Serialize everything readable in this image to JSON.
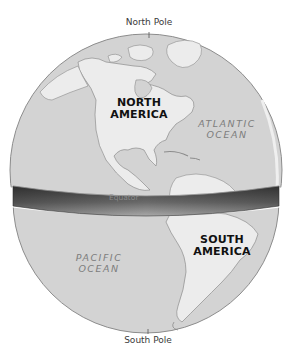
{
  "figure": {
    "type": "globe-diagram",
    "labels": {
      "north_pole": "North Pole",
      "south_pole": "South Pole",
      "equator": "Equator"
    },
    "continents": [
      {
        "line1": "NORTH",
        "line2": "AMERICA"
      },
      {
        "line1": "SOUTH",
        "line2": "AMERICA"
      }
    ],
    "oceans": [
      {
        "line1": "ATLANTIC",
        "line2": "OCEAN"
      },
      {
        "line1": "PACIFIC",
        "line2": "OCEAN"
      }
    ],
    "colors": {
      "ocean": "#d4d4d4",
      "land": "#ececec",
      "outline": "#8c8c8c",
      "equator_band_dark": "#4a4a4a",
      "equator_band_light": "#9a9a9a",
      "label_dark": "#111111",
      "label_ocean": "#7d7d7d"
    }
  }
}
